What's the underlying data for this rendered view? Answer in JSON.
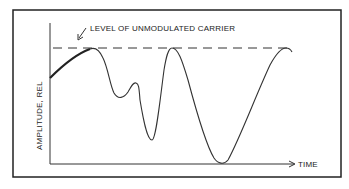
{
  "diagram": {
    "annotation": "LEVEL OF UNMODULATED CARRIER",
    "y_axis_label": "AMPLITUDE, REL",
    "x_axis_label": "TIME",
    "line_color": "#222222",
    "background": "#ffffff"
  }
}
